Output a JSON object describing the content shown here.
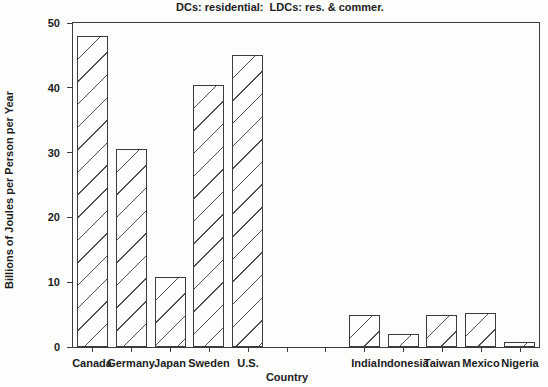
{
  "colors": {
    "background": "#fdfdfc",
    "axis": "#3c3c3c",
    "hatch": "#4f4f4f",
    "text": "#1c1c1c"
  },
  "chart_data": {
    "type": "bar",
    "title": "DCs: residential:  LDCs: res. & commer.",
    "xlabel": "Country",
    "ylabel": "Billions of Joules per Person per Year",
    "ylim": [
      0,
      50
    ],
    "yticks": [
      0,
      10,
      20,
      30,
      40,
      50
    ],
    "categories": [
      "Canada",
      "Germany",
      "Japan",
      "Sweden",
      "U.S.",
      "",
      "",
      "India",
      "Indonesia",
      "Taiwan",
      "Mexico",
      "Nigeria"
    ],
    "values": [
      48,
      30.5,
      10.8,
      40.5,
      45,
      null,
      null,
      5,
      2,
      4.9,
      5.2,
      0.7
    ],
    "bar_fill": "diagonal-hatch",
    "grid": false,
    "legend": null
  }
}
